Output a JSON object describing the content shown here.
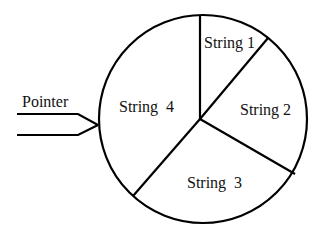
{
  "diagram": {
    "type": "sectored-wheel",
    "colors": {
      "stroke": "#000000",
      "text": "#111111",
      "background": "#ffffff"
    },
    "wheel": {
      "center": [
        203,
        119
      ],
      "radius": 105,
      "hub": [
        200,
        119
      ]
    },
    "sectors": [
      {
        "id": 1,
        "label": "String 1"
      },
      {
        "id": 2,
        "label": "String 2"
      },
      {
        "id": 3,
        "label": "String  3"
      },
      {
        "id": 4,
        "label": "String  4"
      }
    ],
    "pointer": {
      "label": "Pointer"
    }
  }
}
